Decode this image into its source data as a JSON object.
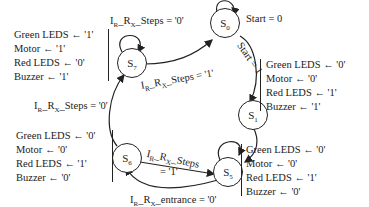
{
  "states": [
    {
      "id": "S0",
      "name": "S",
      "sub": "0"
    },
    {
      "id": "S1",
      "name": "S",
      "sub": "1"
    },
    {
      "id": "S5",
      "name": "S",
      "sub": "5"
    },
    {
      "id": "S6",
      "name": "S",
      "sub": "6"
    },
    {
      "id": "S7",
      "name": "S",
      "sub": "7"
    }
  ],
  "transitions": {
    "s0_self": "Start = 0",
    "s0_to_s1": "Start = 1",
    "s7_self": {
      "pre": "I",
      "s1": "R",
      "mid": "_R",
      "s2": "X",
      "post": "_Steps = '0'"
    },
    "s7_to_s0": {
      "pre": "I",
      "s1": "R",
      "mid": "_R",
      "s2": "X",
      "post": "_Steps = '1'"
    },
    "s6_to_s7": {
      "pre": "I",
      "s1": "R",
      "mid": "_R",
      "s2": "X",
      "post": "_Steps = '0'"
    },
    "s6_to_s5_line1": {
      "pre": "I",
      "s1": "R",
      "mid": "_R",
      "s2": "X",
      "post": "_Steps"
    },
    "s6_to_s5_line2": "= '1'",
    "s5_to_s6": {
      "pre": "I",
      "s1": "R",
      "mid": "_R",
      "s2": "X",
      "post": "_entrance = '0'"
    }
  },
  "outputs": {
    "s7": [
      "Green LEDS  ← '1'",
      "Motor ← '1'",
      "Red LEDS ← '0'",
      "Buzzer ← '1'"
    ],
    "s1": [
      "Green LEDS  ← '0'",
      "Motor ← '0'",
      "Red LEDS ← '1'",
      "Buzzer ← '1'"
    ],
    "s6": [
      "Green LEDS  ← '0'",
      "Motor ← '0'",
      "Red LEDS ← '1'",
      "Buzzer ← '0'"
    ],
    "s5": [
      "Green LEDS  ← '0'",
      "Motor ← '0'",
      "Red LEDS ← '1'",
      "Buzzer ← '0'"
    ]
  }
}
